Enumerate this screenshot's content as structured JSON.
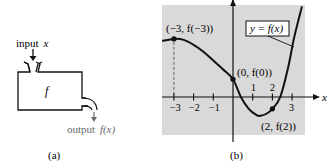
{
  "panel_a": {
    "caption": "(a)",
    "input_label": "input",
    "input_var": "x",
    "box_label": "f",
    "output_label": "output",
    "output_expr": "f(x)",
    "output_color": "#6a6a6a"
  },
  "panel_b": {
    "caption": "(b)",
    "background_color": "#d9d9d9",
    "curve_label": "y = f(x)",
    "x_axis_label": "x",
    "x_ticks_below": [
      "−3",
      "−2",
      "−1",
      "3"
    ],
    "x_ticks_above": [
      "1",
      "2"
    ],
    "points": [
      {
        "label": "(−3, f(−3))",
        "x": -3,
        "y": 2.95
      },
      {
        "label": "(0, f(0))",
        "x": 0,
        "y": 0.9
      },
      {
        "label": "(2, f(2))",
        "x": 2,
        "y": -0.6
      }
    ]
  },
  "chart_data": {
    "type": "line",
    "title": "",
    "xlabel": "x",
    "ylabel": "",
    "legend": "y = f(x)",
    "xlim": [
      -3.6,
      3.6
    ],
    "ylim": [
      -1.85,
      4.6
    ],
    "x_ticks": [
      -3,
      -2,
      -1,
      1,
      2,
      3
    ],
    "grid": false,
    "series": [
      {
        "name": "y = f(x)",
        "x": [
          -3.6,
          -3.0,
          -2.5,
          -2.0,
          -1.5,
          -1.0,
          -0.5,
          0.0,
          0.4,
          0.8,
          1.2,
          1.4,
          1.7,
          2.0,
          2.4,
          2.8,
          3.1,
          3.5
        ],
        "y": [
          2.85,
          2.95,
          2.9,
          2.65,
          2.3,
          1.85,
          1.4,
          0.9,
          0.0,
          -0.6,
          -0.92,
          -0.95,
          -0.85,
          -0.6,
          0.0,
          1.5,
          3.0,
          4.6
        ]
      }
    ],
    "marked_points": [
      {
        "label": "(−3, f(−3))",
        "x": -3,
        "y": 2.95
      },
      {
        "label": "(0, f(0))",
        "x": 0,
        "y": 0.9
      },
      {
        "label": "(2, f(2))",
        "x": 2,
        "y": -0.6
      }
    ]
  }
}
